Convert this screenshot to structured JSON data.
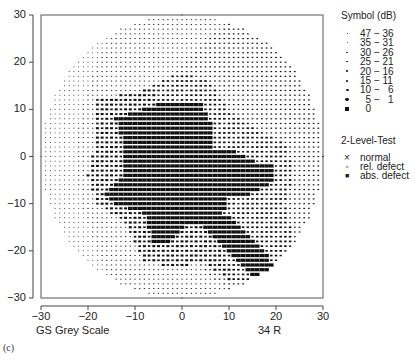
{
  "chart_data": {
    "type": "heatmap",
    "subtitle_left": "GS  Grey Scale",
    "subtitle_right": "34 R",
    "panel_label": "(c)",
    "xlabel": "",
    "ylabel": "",
    "xlim": [
      -30,
      30
    ],
    "ylim": [
      -30,
      30
    ],
    "x_ticks": [
      -30,
      -20,
      -10,
      0,
      10,
      20,
      30
    ],
    "y_ticks": [
      30,
      20,
      10,
      0,
      -10,
      -20,
      -30
    ],
    "x_tick_labels": [
      "−30",
      "−20",
      "−10",
      "0",
      "10",
      "20",
      "30"
    ],
    "y_tick_labels": [
      "30",
      "20",
      "10",
      "0",
      "−10",
      "−20",
      "−30"
    ],
    "grid": false,
    "field_radius_deg": 30,
    "grid_step_deg": 1,
    "regions": [
      {
        "name": "absolute central defect",
        "db": 0,
        "polygon": [
          [
            -14,
            8
          ],
          [
            -8,
            10
          ],
          [
            -2,
            12
          ],
          [
            4,
            12
          ],
          [
            6,
            8
          ],
          [
            7,
            2
          ],
          [
            12,
            1
          ],
          [
            16,
            -1
          ],
          [
            20,
            -1
          ],
          [
            20,
            -5
          ],
          [
            15,
            -8
          ],
          [
            10,
            -9
          ],
          [
            9,
            -12
          ],
          [
            14,
            -16
          ],
          [
            18,
            -20
          ],
          [
            20,
            -24
          ],
          [
            15,
            -26
          ],
          [
            10,
            -20
          ],
          [
            5,
            -15
          ],
          [
            1,
            -14
          ],
          [
            -2,
            -18
          ],
          [
            -6,
            -18
          ],
          [
            -8,
            -12
          ],
          [
            -14,
            -10
          ],
          [
            -16,
            -8
          ],
          [
            -12,
            -4
          ],
          [
            -12,
            2
          ]
        ]
      },
      {
        "name": "relative defect halo",
        "db": 12,
        "polygon": [
          [
            -18,
            12
          ],
          [
            -8,
            14
          ],
          [
            0,
            18
          ],
          [
            6,
            16
          ],
          [
            10,
            10
          ],
          [
            16,
            6
          ],
          [
            22,
            3
          ],
          [
            24,
            -4
          ],
          [
            22,
            -10
          ],
          [
            24,
            -18
          ],
          [
            24,
            -24
          ],
          [
            18,
            -28
          ],
          [
            10,
            -26
          ],
          [
            4,
            -22
          ],
          [
            0,
            -24
          ],
          [
            -8,
            -22
          ],
          [
            -12,
            -14
          ],
          [
            -18,
            -10
          ],
          [
            -20,
            -4
          ],
          [
            -18,
            4
          ]
        ]
      }
    ],
    "background_gradient": {
      "left_db": 34,
      "right_db": 22,
      "top_db_bonus": 0
    }
  },
  "legend": {
    "symbol_title": "Symbol  (dB)",
    "symbols": [
      {
        "range": "47 − 36",
        "size": 0.6
      },
      {
        "range": "35 − 31",
        "size": 0.9
      },
      {
        "range": "30 − 26",
        "size": 1.3
      },
      {
        "range": "25 − 21",
        "size": 1.7
      },
      {
        "range": "20 − 16",
        "size": 2.1
      },
      {
        "range": "15 − 11",
        "size": 2.5
      },
      {
        "range": "10 −   6",
        "size": 3.0
      },
      {
        "range": "  5 −   1",
        "size": 3.5
      },
      {
        "range": "  0",
        "size": 4.6
      }
    ],
    "two_level_title": "2-Level-Test",
    "two_level": [
      {
        "symbol": "×",
        "label": "normal"
      },
      {
        "symbol": "◦",
        "label": "rel. defect"
      },
      {
        "symbol": "■",
        "label": "abs. defect"
      }
    ]
  },
  "colors": {
    "ink": "#111111",
    "frame": "#444444"
  }
}
